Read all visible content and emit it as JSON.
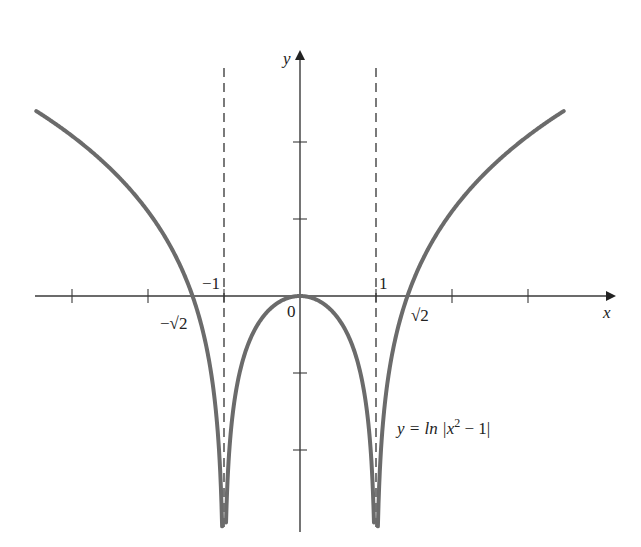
{
  "chart_data": {
    "type": "line",
    "title": "",
    "function_label": "y = ln |x² − 1|",
    "function_parts": {
      "prefix": "y = ln |x",
      "exp": "2",
      "suffix": " − 1|"
    },
    "xlabel": "x",
    "ylabel": "y",
    "origin_label": "0",
    "xlim": [
      -3.5,
      4.1
    ],
    "ylim": [
      -3.05,
      3.2
    ],
    "x_ticks": [
      -3,
      -2,
      -1,
      1,
      2,
      3
    ],
    "y_ticks": [
      -2,
      -1,
      1,
      2
    ],
    "x_tick_labels": [
      {
        "value": -1.414,
        "label": "−√2"
      },
      {
        "value": -1,
        "label": "−1"
      },
      {
        "value": 1,
        "label": "1"
      },
      {
        "value": 1.414,
        "label": "√2"
      }
    ],
    "asymptotes": [
      {
        "x": -1,
        "style": "dashed"
      },
      {
        "x": 1,
        "style": "dashed"
      }
    ],
    "series": [
      {
        "name": "y = ln|x² − 1|",
        "domain": "x < -1",
        "x": [
          -3.47,
          -3,
          -2.5,
          -2,
          -1.5,
          -1.414,
          -1.2,
          -1.05,
          -1.01
        ],
        "y": [
          2.4,
          2.08,
          1.66,
          1.1,
          0.22,
          0,
          -0.79,
          -2.28,
          -3.0
        ]
      },
      {
        "name": "y = ln|x² − 1|",
        "domain": "-1 < x < 1",
        "x": [
          -0.99,
          -0.95,
          -0.8,
          -0.5,
          0,
          0.5,
          0.8,
          0.95,
          0.99
        ],
        "y": [
          -3.0,
          -2.33,
          -1.02,
          -0.29,
          0,
          -0.29,
          -1.02,
          -2.33,
          -3.0
        ]
      },
      {
        "name": "y = ln|x² − 1|",
        "domain": "x > 1",
        "x": [
          1.01,
          1.05,
          1.2,
          1.414,
          1.5,
          2,
          2.5,
          3,
          3.47
        ],
        "y": [
          -3.0,
          -2.28,
          -0.79,
          0,
          0.22,
          1.1,
          1.66,
          2.08,
          2.4
        ]
      }
    ],
    "grid": false,
    "legend": "none",
    "colors": {
      "curve": "#6b6b6b",
      "axis": "#3a3a3a",
      "asymptote": "#333333"
    }
  }
}
